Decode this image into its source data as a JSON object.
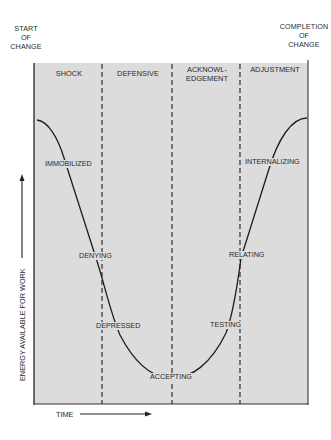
{
  "diagram": {
    "title_left": [
      "START",
      "OF",
      "CHANGE"
    ],
    "title_right": [
      "COMPLETION",
      "OF",
      "CHANGE"
    ],
    "phases": [
      {
        "label": "SHOCK"
      },
      {
        "label": "DEFENSIVE"
      },
      {
        "label_lines": [
          "ACKNOWL-",
          "EDGEMENT"
        ]
      },
      {
        "label": "ADJUSTMENT"
      }
    ],
    "stages": [
      {
        "label": "IMMOBILIZED"
      },
      {
        "label": "DENYING"
      },
      {
        "label": "DEPRESSED"
      },
      {
        "label": "ACCEPTING"
      },
      {
        "label": "TESTING"
      },
      {
        "label": "RELATING"
      },
      {
        "label": "INTERNALIZING"
      }
    ],
    "y_axis_label": "ENERGY AVAILABLE FOR WORK",
    "x_axis_label": "TIME",
    "colors": {
      "panel_fill": "#dcdcdc",
      "line": "#1e1e1e",
      "text": "#2a2a2a"
    }
  }
}
